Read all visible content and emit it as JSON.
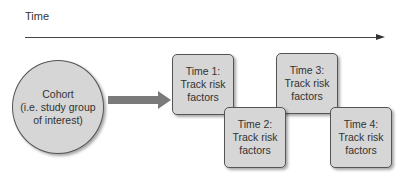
{
  "diagram": {
    "time_axis": {
      "label": "Time"
    },
    "cohort": {
      "lines": [
        "Cohort",
        "(i.e. study group",
        "of interest)"
      ]
    },
    "boxes": [
      {
        "lines": [
          "Time 1:",
          "Track risk",
          "factors"
        ]
      },
      {
        "lines": [
          "Time 2:",
          "Track risk",
          "factors"
        ]
      },
      {
        "lines": [
          "Time 3:",
          "Track risk",
          "factors"
        ]
      },
      {
        "lines": [
          "Time 4:",
          "Track risk",
          "factors"
        ]
      }
    ],
    "colors": {
      "shape_fill": "#d6d6d6",
      "shape_border": "#555555",
      "arrow": "#7a7a7a",
      "axis": "#444444"
    }
  }
}
